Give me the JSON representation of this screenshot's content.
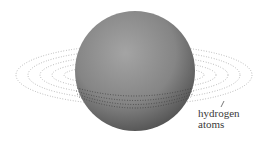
{
  "figure": {
    "label_line1": "hydrogen",
    "label_line2": "atoms",
    "colors": {
      "sphere_light": "#9a9a9a",
      "sphere_dark": "#4a4a4a",
      "dots": "#9c9c9c",
      "text": "#3a3a3a"
    }
  }
}
